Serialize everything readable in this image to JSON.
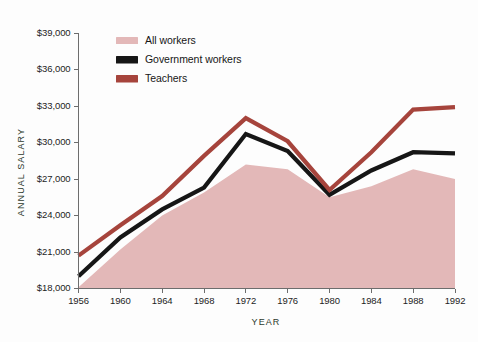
{
  "chart_data": {
    "type": "area",
    "title": "",
    "xlabel": "YEAR",
    "ylabel": "ANNUAL SALARY",
    "x": [
      1956,
      1960,
      1964,
      1968,
      1972,
      1976,
      1980,
      1984,
      1988,
      1992
    ],
    "xtick_labels": [
      "1956",
      "1960",
      "1964",
      "1968",
      "1972",
      "1976",
      "1980",
      "1984",
      "1988",
      "1992"
    ],
    "ytick_labels": [
      "$18,000",
      "$21,000",
      "$24,000",
      "$27,000",
      "$30,000",
      "$33,000",
      "$36,000",
      "$39,000"
    ],
    "ytick_values": [
      18000,
      21000,
      24000,
      27000,
      30000,
      33000,
      36000,
      39000
    ],
    "xlim": [
      1956,
      1992
    ],
    "ylim": [
      18000,
      39000
    ],
    "grid": false,
    "legend_position": "upper-left-inside",
    "series": [
      {
        "name": "All workers",
        "style": "area",
        "color": "#e3b8b8",
        "values": [
          18100,
          21200,
          24000,
          25900,
          28200,
          27800,
          25500,
          26400,
          27800,
          27000
        ]
      },
      {
        "name": "Government workers",
        "style": "line",
        "color": "#161616",
        "values": [
          19000,
          22200,
          24500,
          26300,
          30700,
          29300,
          25700,
          27700,
          29200,
          29100
        ]
      },
      {
        "name": "Teachers",
        "style": "line",
        "color": "#a6443c",
        "values": [
          20700,
          23200,
          25600,
          28900,
          32000,
          30100,
          26100,
          29200,
          32700,
          32900
        ]
      }
    ]
  },
  "legend": {
    "items": [
      {
        "label": "All workers",
        "color": "#e3b8b8"
      },
      {
        "label": "Government workers",
        "color": "#161616"
      },
      {
        "label": "Teachers",
        "color": "#a6443c"
      }
    ]
  },
  "axes": {
    "y_title": "ANNUAL SALARY",
    "x_title": "YEAR"
  },
  "colors": {
    "background": "#fdfdfd",
    "axis": "#6d6d6d",
    "text": "#1d1d1d",
    "axis_title": "#2c3a2c",
    "all_workers": "#e3b8b8",
    "government_workers": "#161616",
    "teachers": "#a6443c"
  }
}
